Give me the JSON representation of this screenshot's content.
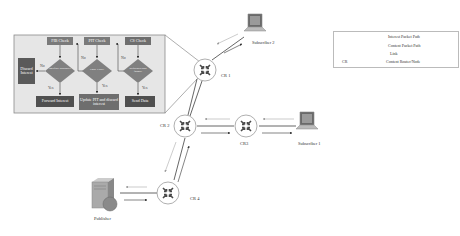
{
  "diagram": {
    "colors": {
      "flowchart_bg": "#e6e6e6",
      "flowchart_border": "#8a8a8a",
      "check_box": "#7a7a7a",
      "diamond": "#808080",
      "action_dark": "#505050",
      "action_mid": "#6e6e6e",
      "router_stroke": "#9a9a9a",
      "router_arrow": "#4a4a4a",
      "line": "#555555"
    },
    "flowchart": {
      "checks": [
        {
          "label": "FIB Check"
        },
        {
          "label": "PIT Check"
        },
        {
          "label": "CS Check"
        }
      ],
      "decisions": [
        {
          "label": "Interface available?"
        },
        {
          "label": "Entry Exist?"
        },
        {
          "label": "Requested data found?"
        }
      ],
      "actions": [
        {
          "label": "Forward Interest"
        },
        {
          "label": "Update PIT and discard interest"
        },
        {
          "label": "Send Data"
        }
      ],
      "discard": {
        "label": "Discard Interest"
      },
      "branch_labels": {
        "no": "No",
        "yes": "Yes"
      }
    },
    "nodes": {
      "cr1": {
        "label": "CR 1"
      },
      "cr2": {
        "label": "CR 2"
      },
      "cr3": {
        "label": "CR3"
      },
      "cr4": {
        "label": "CR 4"
      },
      "subscriber1": {
        "label": "Subscriber 1"
      },
      "subscriber2": {
        "label": "Subscriber 2"
      },
      "publisher": {
        "label": "Publisher"
      }
    },
    "legend": {
      "items": [
        {
          "label": "Interest Packet Path"
        },
        {
          "label": "Content Packet Path"
        },
        {
          "label": "Link"
        },
        {
          "prefix": "CR",
          "label": "Content Router/Node"
        }
      ]
    }
  }
}
